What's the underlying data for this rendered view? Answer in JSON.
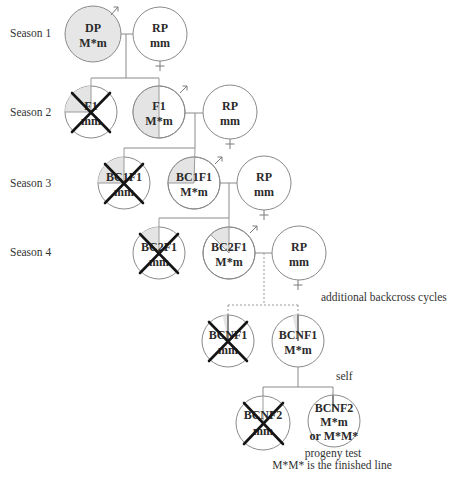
{
  "seasons": [
    {
      "label": "Season 1"
    },
    {
      "label": "Season 2"
    },
    {
      "label": "Season 3"
    },
    {
      "label": "Season 4"
    }
  ],
  "nodes": {
    "dp": {
      "line1": "DP",
      "line2": "M*m",
      "sex": "male-symbol",
      "fill": "full"
    },
    "rp1": {
      "line1": "RP",
      "line2": "mm",
      "sex": "female-symbol"
    },
    "f1_mm": {
      "line1": "F1",
      "line2": "mm",
      "status": "discarded"
    },
    "f1_mm_het": {
      "line1": "F1",
      "line2": "M*m",
      "sex": "male-symbol",
      "fill": "half"
    },
    "rp2": {
      "line1": "RP",
      "line2": "mm",
      "sex": "female-symbol"
    },
    "bc1_mm": {
      "line1": "BC1F1",
      "line2": "mm",
      "status": "discarded"
    },
    "bc1_het": {
      "line1": "BC1F1",
      "line2": "M*m",
      "sex": "male-symbol",
      "fill": "quarter"
    },
    "rp3": {
      "line1": "RP",
      "line2": "mm",
      "sex": "female-symbol"
    },
    "bc2_mm": {
      "line1": "BC2F1",
      "line2": "mm",
      "status": "discarded"
    },
    "bc2_het": {
      "line1": "BC2F1",
      "line2": "M*m",
      "sex": "male-symbol",
      "fill": "eighth"
    },
    "rp4": {
      "line1": "RP",
      "line2": "mm",
      "sex": "female-symbol"
    },
    "bcn1_mm": {
      "line1": "BCNF1",
      "line2": "mm",
      "status": "discarded"
    },
    "bcn1_het": {
      "line1": "BCNF1",
      "line2": "M*m",
      "fill": "sliver"
    },
    "bcn2_mm": {
      "line1": "BCNF2",
      "line2": "mm",
      "status": "discarded"
    },
    "bcn2_sel": {
      "line1": "BCNF2",
      "line2": "M*m",
      "line3": "or M*M*"
    }
  },
  "annotations": {
    "additional": "additional backcross cycles",
    "self": "self",
    "progeny": "progeny test",
    "finished": "M*M* is the finished line"
  },
  "colors": {
    "shade": "#e4e4e4",
    "outline": "#8a8a8a",
    "cross": "#151515"
  }
}
